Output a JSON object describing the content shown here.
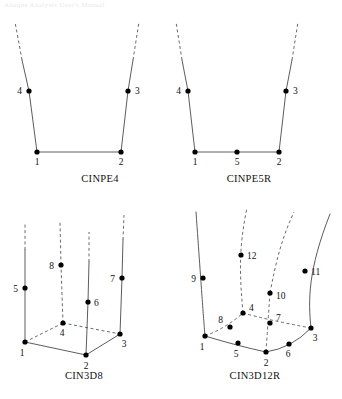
{
  "page": {
    "faint_header_text": "Abaqus Analysis User's Manual",
    "background_color": "#ffffff",
    "ink_color": "#111111",
    "line_color": "#4a4a4a",
    "node_color": "#000000",
    "width": 342,
    "height": 399
  },
  "figures": [
    {
      "id": "cinpe4",
      "caption": "CINPE4",
      "caption_pos": {
        "x": 100,
        "y": 182
      },
      "solid_edges": [
        {
          "from": [
            37,
            152
          ],
          "to": [
            121,
            152
          ]
        },
        {
          "from": [
            37,
            152
          ],
          "to": [
            29,
            91
          ]
        },
        {
          "from": [
            29,
            91
          ],
          "to": [
            22,
            60
          ]
        },
        {
          "from": [
            121,
            152
          ],
          "to": [
            128,
            91
          ]
        },
        {
          "from": [
            128,
            91
          ],
          "to": [
            133,
            60
          ]
        }
      ],
      "dashed_edges": [
        {
          "from": [
            22,
            60
          ],
          "to": [
            15,
            22
          ]
        },
        {
          "from": [
            133,
            60
          ],
          "to": [
            139,
            22
          ]
        }
      ],
      "nodes": [
        {
          "label": "1",
          "x": 37,
          "y": 152,
          "lx": 37,
          "ly": 165,
          "anchor": "middle"
        },
        {
          "label": "2",
          "x": 121,
          "y": 152,
          "lx": 121,
          "ly": 165,
          "anchor": "middle"
        },
        {
          "label": "3",
          "x": 128,
          "y": 91,
          "lx": 135,
          "ly": 94,
          "anchor": "start"
        },
        {
          "label": "4",
          "x": 29,
          "y": 91,
          "lx": 22,
          "ly": 94,
          "anchor": "end"
        }
      ]
    },
    {
      "id": "cinpe5r",
      "caption": "CINPE5R",
      "caption_pos": {
        "x": 249,
        "y": 182
      },
      "solid_edges": [
        {
          "from": [
            195,
            152
          ],
          "to": [
            279,
            152
          ]
        },
        {
          "from": [
            195,
            152
          ],
          "to": [
            188,
            91
          ]
        },
        {
          "from": [
            188,
            91
          ],
          "to": [
            182,
            60
          ]
        },
        {
          "from": [
            279,
            152
          ],
          "to": [
            286,
            91
          ]
        },
        {
          "from": [
            286,
            91
          ],
          "to": [
            292,
            60
          ]
        }
      ],
      "dashed_edges": [
        {
          "from": [
            182,
            60
          ],
          "to": [
            176,
            22
          ]
        },
        {
          "from": [
            292,
            60
          ],
          "to": [
            298,
            22
          ]
        }
      ],
      "nodes": [
        {
          "label": "1",
          "x": 195,
          "y": 152,
          "lx": 195,
          "ly": 165,
          "anchor": "middle"
        },
        {
          "label": "2",
          "x": 279,
          "y": 152,
          "lx": 279,
          "ly": 165,
          "anchor": "middle"
        },
        {
          "label": "3",
          "x": 286,
          "y": 91,
          "lx": 293,
          "ly": 94,
          "anchor": "start"
        },
        {
          "label": "4",
          "x": 188,
          "y": 91,
          "lx": 181,
          "ly": 94,
          "anchor": "end"
        },
        {
          "label": "5",
          "x": 237,
          "y": 152,
          "lx": 237,
          "ly": 165,
          "anchor": "middle"
        }
      ]
    },
    {
      "id": "cin3d8",
      "caption": "CIN3D8",
      "caption_pos": {
        "x": 84,
        "y": 379
      },
      "solid_edges": [
        {
          "from": [
            25,
            342
          ],
          "to": [
            86,
            355
          ]
        },
        {
          "from": [
            86,
            355
          ],
          "to": [
            120,
            334
          ]
        },
        {
          "from": [
            25,
            342
          ],
          "to": [
            25,
            288
          ]
        },
        {
          "from": [
            25,
            288
          ],
          "to": [
            25,
            250
          ]
        },
        {
          "from": [
            86,
            355
          ],
          "to": [
            88,
            302
          ]
        },
        {
          "from": [
            88,
            302
          ],
          "to": [
            89,
            262
          ]
        },
        {
          "from": [
            120,
            334
          ],
          "to": [
            122,
            278
          ]
        },
        {
          "from": [
            122,
            278
          ],
          "to": [
            123,
            240
          ]
        }
      ],
      "dashed_edges": [
        {
          "from": [
            25,
            342
          ],
          "to": [
            63,
            323
          ]
        },
        {
          "from": [
            63,
            323
          ],
          "to": [
            120,
            334
          ]
        },
        {
          "from": [
            63,
            323
          ],
          "to": [
            61,
            265
          ]
        },
        {
          "from": [
            61,
            265
          ],
          "to": [
            60,
            222
          ]
        },
        {
          "from": [
            25,
            250
          ],
          "to": [
            25,
            222
          ]
        },
        {
          "from": [
            89,
            262
          ],
          "to": [
            89,
            232
          ]
        },
        {
          "from": [
            123,
            240
          ],
          "to": [
            124,
            215
          ]
        }
      ],
      "nodes": [
        {
          "label": "1",
          "x": 25,
          "y": 342,
          "lx": 22,
          "ly": 356,
          "anchor": "middle"
        },
        {
          "label": "2",
          "x": 86,
          "y": 355,
          "lx": 86,
          "ly": 369,
          "anchor": "middle"
        },
        {
          "label": "3",
          "x": 120,
          "y": 334,
          "lx": 124,
          "ly": 347,
          "anchor": "middle"
        },
        {
          "label": "4",
          "x": 63,
          "y": 323,
          "lx": 62,
          "ly": 336,
          "anchor": "middle"
        },
        {
          "label": "5",
          "x": 25,
          "y": 288,
          "lx": 18,
          "ly": 292,
          "anchor": "end"
        },
        {
          "label": "6",
          "x": 88,
          "y": 302,
          "lx": 94,
          "ly": 306,
          "anchor": "start"
        },
        {
          "label": "7",
          "x": 122,
          "y": 278,
          "lx": 115,
          "ly": 282,
          "anchor": "end"
        },
        {
          "label": "8",
          "x": 61,
          "y": 265,
          "lx": 54,
          "ly": 269,
          "anchor": "end"
        }
      ]
    },
    {
      "id": "cin3d12r",
      "caption": "CIN3D12R",
      "caption_pos": {
        "x": 255,
        "y": 379
      },
      "solid_edges": [],
      "solid_curves": [
        {
          "d": "M 205 336 Q 238 346 266 352"
        },
        {
          "d": "M 266 352 Q 292 348 311 328"
        },
        {
          "d": "M 205 336 C 203 312 202 296 196 212"
        },
        {
          "d": "M 311 328 C 308 300 308 270 330 214"
        }
      ],
      "dashed_curves": [
        {
          "d": "M 205 336 Q 226 328 243 313"
        },
        {
          "d": "M 243 313 Q 268 320 311 328"
        },
        {
          "d": "M 243 313 C 240 278 238 250 247 208"
        },
        {
          "d": "M 266 352 Q 268 322 270 293"
        },
        {
          "d": "M 270 293 C 276 262 281 240 294 212"
        }
      ],
      "nodes": [
        {
          "label": "1",
          "x": 205,
          "y": 336,
          "lx": 202,
          "ly": 350,
          "anchor": "middle"
        },
        {
          "label": "2",
          "x": 266,
          "y": 352,
          "lx": 266,
          "ly": 366,
          "anchor": "middle"
        },
        {
          "label": "3",
          "x": 311,
          "y": 328,
          "lx": 315,
          "ly": 341,
          "anchor": "middle"
        },
        {
          "label": "4",
          "x": 243,
          "y": 313,
          "lx": 249,
          "ly": 311,
          "anchor": "start"
        },
        {
          "label": "5",
          "x": 238,
          "y": 343,
          "lx": 236,
          "ly": 357,
          "anchor": "middle"
        },
        {
          "label": "6",
          "x": 289,
          "y": 344,
          "lx": 288,
          "ly": 357,
          "anchor": "middle"
        },
        {
          "label": "7",
          "x": 270,
          "y": 323,
          "lx": 276,
          "ly": 321,
          "anchor": "start"
        },
        {
          "label": "8",
          "x": 230,
          "y": 327,
          "lx": 223,
          "ly": 323,
          "anchor": "end"
        },
        {
          "label": "9",
          "x": 203,
          "y": 278,
          "lx": 196,
          "ly": 282,
          "anchor": "end"
        },
        {
          "label": "10",
          "x": 270,
          "y": 293,
          "lx": 276,
          "ly": 299,
          "anchor": "start"
        },
        {
          "label": "11",
          "x": 305,
          "y": 271,
          "lx": 311,
          "ly": 275,
          "anchor": "start"
        },
        {
          "label": "12",
          "x": 241,
          "y": 255,
          "lx": 247,
          "ly": 259,
          "anchor": "start"
        }
      ]
    }
  ]
}
